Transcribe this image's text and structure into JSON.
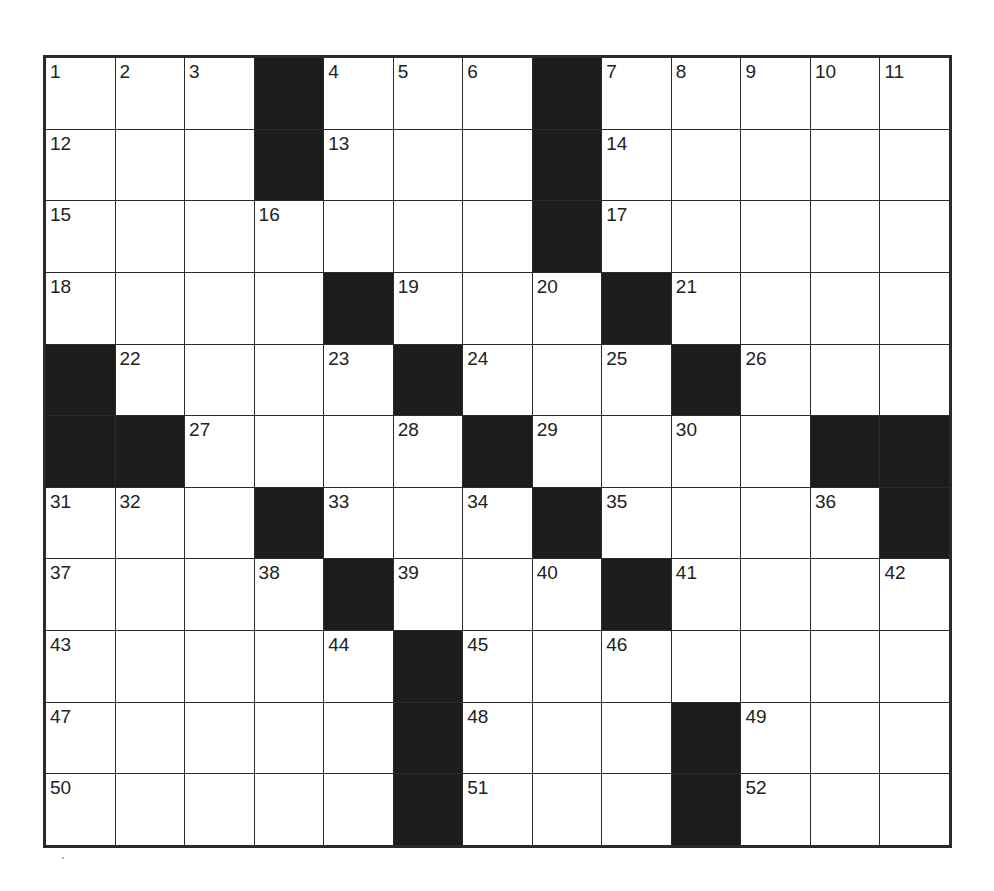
{
  "puzzle": {
    "rows": 11,
    "cols": 13,
    "colors": {
      "black": "#1c1c1c",
      "white": "#ffffff",
      "line": "#2a2a2a"
    },
    "grid": [
      [
        "1",
        "2",
        "3",
        "#",
        "4",
        "5",
        "6",
        "#",
        "7",
        "8",
        "9",
        "10",
        "11"
      ],
      [
        "12",
        "",
        "",
        "#",
        "13",
        "",
        "",
        "#",
        "14",
        "",
        "",
        "",
        ""
      ],
      [
        "15",
        "",
        "",
        "16",
        "",
        "",
        "",
        "#",
        "17",
        "",
        "",
        "",
        ""
      ],
      [
        "18",
        "",
        "",
        "",
        "#",
        "19",
        "",
        "20",
        "#",
        "21",
        "",
        "",
        ""
      ],
      [
        "#",
        "22",
        "",
        "",
        "23",
        "#",
        "24",
        "",
        "25",
        "#",
        "26",
        "",
        ""
      ],
      [
        "#",
        "#",
        "27",
        "",
        "",
        "28",
        "#",
        "29",
        "",
        "30",
        "",
        "#",
        "#"
      ],
      [
        "31",
        "32",
        "",
        "#",
        "33",
        "",
        "34",
        "#",
        "35",
        "",
        "",
        "36",
        "#"
      ],
      [
        "37",
        "",
        "",
        "38",
        "#",
        "39",
        "",
        "40",
        "#",
        "41",
        "",
        "",
        "42"
      ],
      [
        "43",
        "",
        "",
        "",
        "44",
        "#",
        "45",
        "",
        "46",
        "",
        "",
        "",
        ""
      ],
      [
        "47",
        "",
        "",
        "",
        "",
        "#",
        "48",
        "",
        "",
        "#",
        "49",
        "",
        ""
      ],
      [
        "50",
        "",
        "",
        "",
        "",
        "#",
        "51",
        "",
        "",
        "#",
        "52",
        "",
        ""
      ]
    ]
  }
}
